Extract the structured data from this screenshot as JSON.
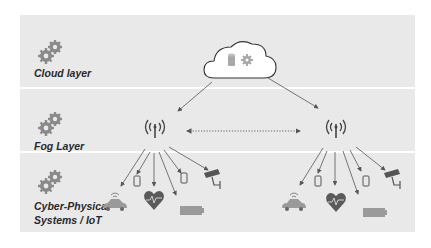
{
  "layers": [
    {
      "id": "cloud",
      "label": "Cloud layer",
      "icon": "gears-icon"
    },
    {
      "id": "fog",
      "label": "Fog Layer",
      "icon": "gears-icon"
    },
    {
      "id": "cps",
      "label_line1": "Cyber-Physical",
      "label_line2": "Systems / IoT",
      "icon": "gears-icon"
    }
  ],
  "nodes": {
    "cloud": {
      "icons": [
        "database-icon",
        "gear-icon"
      ]
    },
    "fog_nodes": [
      {
        "icon": "antenna-icon"
      },
      {
        "icon": "antenna-icon"
      }
    ],
    "fog_link": "dotted-bidirectional-arrow",
    "devices": [
      "connected-car-icon",
      "smartphone-icon",
      "heart-rate-icon",
      "battery-icon",
      "smartphone-icon",
      "security-camera-icon"
    ]
  },
  "colors": {
    "band": "#e9e9e9",
    "icon_gray": "#8a8a8a",
    "dark_gray": "#555555",
    "text": "#2a2a2a"
  }
}
